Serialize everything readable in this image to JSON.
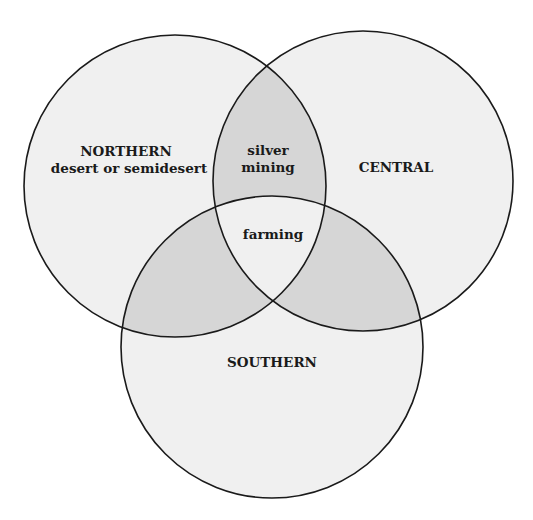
{
  "diagram": {
    "type": "venn",
    "colors": {
      "background": "#ffffff",
      "single_region": "#f0f0f0",
      "pairwise_overlap": "#d6d6d6",
      "triple_overlap": "#f0f0f0",
      "outline": "#1a1a1a",
      "text": "#1a1a1a"
    },
    "sets": [
      {
        "id": "northern",
        "label": "NORTHERN",
        "sublabel": "desert or semidesert"
      },
      {
        "id": "central",
        "label": "CENTRAL"
      },
      {
        "id": "southern",
        "label": "SOUTHERN"
      }
    ],
    "overlaps": {
      "northern_central": {
        "line1": "silver",
        "line2": "mining"
      },
      "all_three": {
        "label": "farming"
      }
    }
  }
}
